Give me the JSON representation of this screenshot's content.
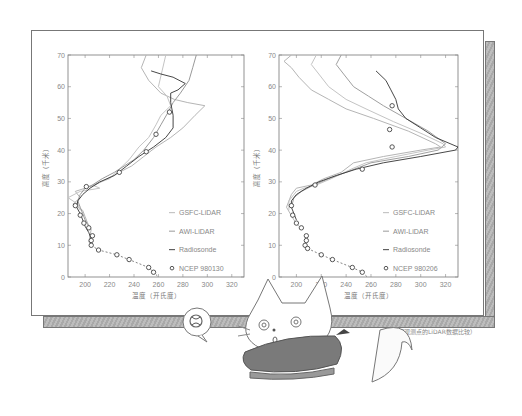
{
  "caption": "（不同观测点的LiDAR数据比较）",
  "chart_data": [
    {
      "type": "line",
      "title": "",
      "xlabel": "温度（开氏度）",
      "ylabel": "高度（千米）",
      "xlim": [
        186,
        330
      ],
      "ylim": [
        0,
        70
      ],
      "xticks": [
        200,
        220,
        240,
        260,
        280,
        300,
        320
      ],
      "yticks": [
        0,
        10,
        20,
        30,
        40,
        50,
        60,
        70
      ],
      "grid": false,
      "legend_position": "lower right",
      "legend": [
        "GSFC-LiDAR",
        "AWI-LiDAR",
        "Radiosonde",
        "NCEP 980130"
      ],
      "series": [
        {
          "name": "GSFC-LiDAR",
          "color": "#b5b5b5",
          "points": [
            [
              250,
              70
            ],
            [
              246,
              66
            ],
            [
              252,
              62
            ],
            [
              262,
              58
            ],
            [
              273,
              56
            ],
            [
              284,
              55
            ],
            [
              298,
              54
            ],
            [
              290,
              51
            ],
            [
              280,
              47
            ],
            [
              270,
              44
            ],
            [
              258,
              41
            ],
            [
              248,
              38
            ],
            [
              238,
              35
            ],
            [
              228,
              33
            ],
            [
              218,
              31
            ],
            [
              208,
              29
            ],
            [
              200,
              28
            ],
            [
              192,
              27
            ],
            [
              196,
              25
            ],
            [
              190,
              23
            ],
            [
              198,
              21
            ],
            [
              200,
              19
            ],
            [
              202,
              17
            ],
            [
              205,
              15
            ],
            [
              204,
              13
            ],
            [
              203,
              11
            ],
            [
              206,
              10
            ]
          ]
        },
        {
          "name": "GSFC-LiDAR (2)",
          "color": "#c4c4c4",
          "points": [
            [
              266,
              70
            ],
            [
              263,
              65
            ],
            [
              260,
              60
            ],
            [
              267,
              57
            ],
            [
              270,
              54
            ],
            [
              262,
              51
            ],
            [
              258,
              48
            ],
            [
              252,
              44
            ],
            [
              244,
              41
            ],
            [
              236,
              37
            ],
            [
              228,
              34
            ],
            [
              220,
              31
            ],
            [
              206,
              29
            ],
            [
              212,
              28
            ],
            [
              196,
              27
            ],
            [
              186,
              25
            ],
            [
              194,
              23
            ],
            [
              196,
              21
            ]
          ]
        },
        {
          "name": "AWI-LiDAR",
          "color": "#9a9a9a",
          "points": [
            [
              291,
              70
            ],
            [
              288,
              66
            ],
            [
              285,
              62
            ],
            [
              278,
              58
            ],
            [
              272,
              55
            ],
            [
              268,
              52
            ],
            [
              262,
              48
            ],
            [
              256,
              44
            ],
            [
              248,
              40
            ],
            [
              240,
              37
            ],
            [
              232,
              35
            ],
            [
              224,
              33
            ],
            [
              214,
              31
            ],
            [
              206,
              29
            ],
            [
              200,
              28
            ],
            [
              196,
              26
            ],
            [
              194,
              24
            ],
            [
              196,
              22
            ],
            [
              198,
              20
            ],
            [
              200,
              18
            ],
            [
              203,
              16
            ]
          ]
        },
        {
          "name": "Radiosonde",
          "color": "#333333",
          "points": [
            [
              254,
              65
            ],
            [
              262,
              64
            ],
            [
              272,
              63
            ],
            [
              282,
              61
            ],
            [
              276,
              59
            ],
            [
              270,
              58
            ],
            [
              270,
              55
            ],
            [
              272,
              51
            ],
            [
              272,
              47
            ],
            [
              266,
              44
            ],
            [
              256,
              41
            ],
            [
              244,
              38
            ],
            [
              234,
              35
            ],
            [
              224,
              32
            ],
            [
              212,
              30
            ],
            [
              204,
              28
            ],
            [
              198,
              26
            ],
            [
              194,
              24
            ],
            [
              193,
              22
            ],
            [
              196,
              20
            ],
            [
              198,
              18
            ],
            [
              200,
              16
            ],
            [
              203,
              14
            ],
            [
              205,
              12
            ],
            [
              205,
              10
            ]
          ]
        },
        {
          "name": "NCEP 980130",
          "style": "circle-dashed",
          "color": "#444444",
          "points": [
            [
              269,
              52
            ],
            [
              258,
              45
            ],
            [
              250,
              39.5
            ],
            [
              228,
              33
            ],
            [
              201,
              28.5
            ],
            [
              192,
              22.5
            ],
            [
              196,
              19.5
            ],
            [
              199,
              17
            ],
            [
              203,
              15.5
            ],
            [
              206,
              13
            ],
            [
              205,
              11.5
            ],
            [
              205,
              10
            ],
            [
              211,
              8.5
            ],
            [
              226,
              7
            ],
            [
              236,
              5.5
            ],
            [
              252,
              3
            ],
            [
              256,
              1.5
            ],
            [
              260,
              0
            ]
          ]
        }
      ]
    },
    {
      "type": "line",
      "title": "",
      "xlabel": "温度（开氏度）",
      "ylabel": "高度（千米）",
      "xlim": [
        186,
        330
      ],
      "ylim": [
        0,
        70
      ],
      "xticks": [
        200,
        220,
        240,
        260,
        280,
        300,
        320
      ],
      "yticks": [
        0,
        10,
        20,
        30,
        40,
        50,
        60,
        70
      ],
      "grid": false,
      "legend_position": "lower right",
      "legend": [
        "GSFC-LiDAR",
        "AWI-LiDAR",
        "Radiosonde",
        "NCEP 980206"
      ],
      "series": [
        {
          "name": "GSFC-LiDAR",
          "color": "#b5b5b5",
          "points": [
            [
              196,
              70
            ],
            [
              190,
              68
            ],
            [
              196,
              66
            ],
            [
              202,
              63
            ],
            [
              212,
              59
            ],
            [
              226,
              56
            ],
            [
              240,
              53
            ],
            [
              262,
              50
            ],
            [
              290,
              46
            ],
            [
              312,
              42
            ],
            [
              316,
              41
            ],
            [
              300,
              40
            ],
            [
              270,
              38
            ],
            [
              246,
              36
            ],
            [
              236,
              33
            ],
            [
              222,
              31
            ],
            [
              212,
              29
            ],
            [
              200,
              28
            ],
            [
              196,
              26
            ],
            [
              192,
              22
            ],
            [
              195,
              20
            ],
            [
              198,
              18
            ],
            [
              202,
              16
            ]
          ]
        },
        {
          "name": "GSFC-LiDAR (2)",
          "color": "#c4c4c4",
          "points": [
            [
              216,
              70
            ],
            [
              212,
              67
            ],
            [
              218,
              64
            ],
            [
              226,
              60
            ],
            [
              240,
              56
            ],
            [
              256,
              53
            ],
            [
              278,
              49
            ],
            [
              302,
              45
            ],
            [
              318,
              42
            ],
            [
              320,
              41
            ],
            [
              306,
              40
            ],
            [
              280,
              38
            ],
            [
              256,
              36
            ],
            [
              244,
              34
            ],
            [
              228,
              31
            ],
            [
              216,
              29
            ],
            [
              206,
              28
            ],
            [
              200,
              27
            ],
            [
              194,
              24
            ],
            [
              194,
              21
            ]
          ]
        },
        {
          "name": "AWI-LiDAR",
          "color": "#a0a0a0",
          "points": [
            [
              236,
              70
            ],
            [
              232,
              67
            ],
            [
              238,
              64
            ],
            [
              246,
              60
            ],
            [
              258,
              57
            ],
            [
              270,
              54
            ],
            [
              288,
              50
            ],
            [
              306,
              46
            ],
            [
              320,
              42
            ],
            [
              314,
              40
            ],
            [
              290,
              38
            ],
            [
              260,
              36
            ],
            [
              240,
              33
            ],
            [
              226,
              31
            ],
            [
              214,
              29
            ],
            [
              204,
              27
            ],
            [
              198,
              25
            ],
            [
              196,
              22
            ]
          ]
        },
        {
          "name": "Radiosonde",
          "color": "#333333",
          "points": [
            [
              264,
              65
            ],
            [
              272,
              62
            ],
            [
              276,
              59
            ],
            [
              280,
              56
            ],
            [
              282,
              53
            ],
            [
              288,
              50
            ],
            [
              300,
              47
            ],
            [
              312,
              44
            ],
            [
              330,
              41
            ],
            [
              328,
              40
            ],
            [
              300,
              38
            ],
            [
              270,
              36
            ],
            [
              248,
              34
            ],
            [
              232,
              32
            ],
            [
              218,
              30
            ],
            [
              208,
              28
            ],
            [
              200,
              26
            ],
            [
              196,
              24
            ],
            [
              196,
              22
            ],
            [
              198,
              20
            ],
            [
              200,
              18
            ]
          ]
        },
        {
          "name": "NCEP 980206",
          "style": "circle-dashed",
          "color": "#444444",
          "points": [
            [
              277,
              54
            ],
            [
              275,
              46.5
            ],
            [
              277,
              41
            ],
            [
              253,
              34
            ],
            [
              215,
              29
            ],
            [
              196,
              22.5
            ],
            [
              197,
              19.5
            ],
            [
              200,
              17
            ],
            [
              204,
              15.5
            ],
            [
              208,
              13
            ],
            [
              208,
              11.5
            ],
            [
              207,
              10
            ],
            [
              209,
              9
            ],
            [
              220,
              7
            ],
            [
              229,
              5.5
            ],
            [
              245,
              3
            ],
            [
              253,
              1.5
            ],
            [
              257,
              0
            ]
          ]
        }
      ]
    }
  ]
}
